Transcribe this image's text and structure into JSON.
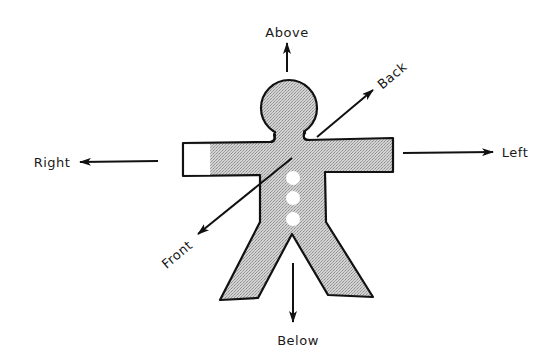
{
  "diagram": {
    "colors": {
      "outline": "#111111",
      "fill": "#c6c6c6",
      "fill_dot": "#9a9a9a",
      "background": "#ffffff",
      "button": "#ffffff"
    },
    "labels": {
      "above": "Above",
      "below": "Below",
      "left": "Left",
      "right": "Right",
      "front": "Front",
      "back": "Back"
    },
    "buttons_count": 3
  }
}
